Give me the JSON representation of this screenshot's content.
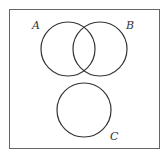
{
  "diagram": {
    "type": "venn",
    "sets": [
      {
        "label": "A",
        "cx": 68,
        "cy": 49,
        "r": 27
      },
      {
        "label": "B",
        "cx": 100,
        "cy": 49,
        "r": 27
      },
      {
        "label": "C",
        "cx": 84,
        "cy": 110,
        "r": 27
      }
    ],
    "border_color": "#555555",
    "stroke_color": "#333333"
  }
}
